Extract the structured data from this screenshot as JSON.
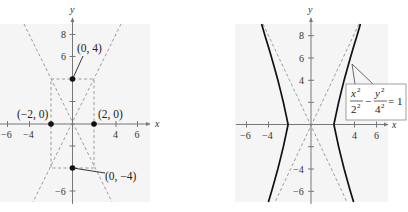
{
  "colors": {
    "panel_bg": "#f5f5f5",
    "axis": "#777777",
    "dash": "#9a9a9a",
    "curve": "#111111",
    "point": "#111111",
    "text": "#222222"
  },
  "left_graph": {
    "axis_labels": {
      "x": "x",
      "y": "y"
    },
    "x_ticks": [
      {
        "value": -6,
        "label": "−6"
      },
      {
        "value": -4,
        "label": "−4"
      },
      {
        "value": 4,
        "label": "4"
      },
      {
        "value": 6,
        "label": "6"
      }
    ],
    "y_ticks": [
      {
        "value": 8,
        "label": "8"
      },
      {
        "value": 6,
        "label": "6"
      },
      {
        "value": 2,
        "label": ""
      },
      {
        "value": -2,
        "label": ""
      },
      {
        "value": -6,
        "label": "−6"
      }
    ],
    "points": [
      {
        "x": 0,
        "y": 4,
        "label": "(0, 4)"
      },
      {
        "x": -2,
        "y": 0,
        "label": "(−2, 0)"
      },
      {
        "x": 2,
        "y": 0,
        "label": "(2, 0)"
      },
      {
        "x": 0,
        "y": -4,
        "label": "(0, −4)"
      }
    ],
    "asymptotes": [
      "y = 2x",
      "y = −2x"
    ],
    "rectangle": {
      "x": [
        -2,
        2
      ],
      "y": [
        -4,
        4
      ]
    }
  },
  "right_graph": {
    "axis_labels": {
      "x": "x",
      "y": "y"
    },
    "x_ticks": [
      {
        "value": -6,
        "label": "−6"
      },
      {
        "value": -4,
        "label": "−4"
      },
      {
        "value": 4,
        "label": "4"
      },
      {
        "value": 6,
        "label": "6"
      }
    ],
    "y_ticks": [
      {
        "value": 8,
        "label": "8"
      },
      {
        "value": 6,
        "label": "6"
      },
      {
        "value": 4,
        "label": "4"
      },
      {
        "value": 2,
        "label": ""
      },
      {
        "value": -2,
        "label": ""
      },
      {
        "value": -4,
        "label": "−4"
      },
      {
        "value": -6,
        "label": "−6"
      }
    ],
    "equation": {
      "term1_num": "x",
      "term1_den": "2",
      "term2_num": "y",
      "term2_den": "4",
      "exp": "2",
      "minus": "−",
      "equals": "= 1"
    },
    "curve": "hyperbola x²/2² − y²/4² = 1"
  }
}
